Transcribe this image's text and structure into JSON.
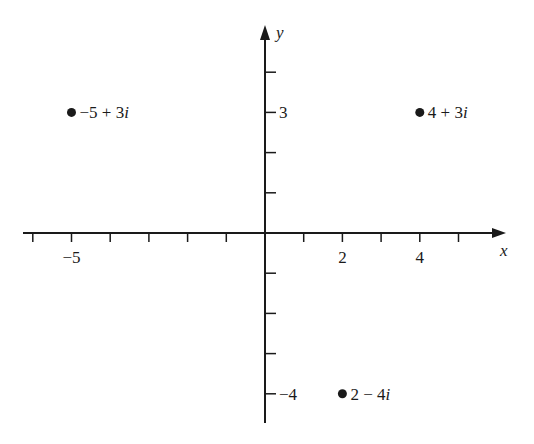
{
  "chart_data": {
    "type": "scatter",
    "title": "",
    "xlabel": "x",
    "ylabel": "y",
    "xlim": [
      -6,
      5.5
    ],
    "ylim": [
      -5,
      5
    ],
    "grid": false,
    "x_tick_positions": [
      -6,
      -5,
      -4,
      -3,
      -2,
      -1,
      1,
      2,
      3,
      4,
      5
    ],
    "x_tick_labels": [
      {
        "value": -5,
        "text": "−5"
      },
      {
        "value": 2,
        "text": "2"
      },
      {
        "value": 4,
        "text": "4"
      }
    ],
    "y_tick_positions": [
      -4,
      -3,
      -2,
      -1,
      1,
      2,
      3,
      4
    ],
    "y_tick_labels": [
      {
        "value": 3,
        "text": "3"
      },
      {
        "value": -4,
        "text": "−4"
      }
    ],
    "points": [
      {
        "x": -5,
        "y": 3,
        "label": "−5 + 3i",
        "re": "−5",
        "op": "+",
        "im": "3"
      },
      {
        "x": 4,
        "y": 3,
        "label": "4 + 3i",
        "re": "4",
        "op": "+",
        "im": "3"
      },
      {
        "x": 2,
        "y": -4,
        "label": "2 − 4i",
        "re": "2",
        "op": "−",
        "im": "4"
      }
    ]
  },
  "colors": {
    "ink": "#1a1a1a",
    "background": "#ffffff"
  }
}
